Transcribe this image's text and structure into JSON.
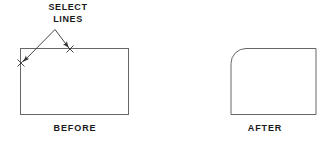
{
  "diagram": {
    "type": "cad-fillet-instruction",
    "background_color": "#ffffff",
    "line_color": "#555555",
    "leader_color": "#333333",
    "text_color": "#1a1a1a",
    "annotation": {
      "line1": "SELECT",
      "line2": "LINES"
    },
    "captions": {
      "before": "BEFORE",
      "after": "AFTER"
    },
    "before_shape": {
      "name": "rectangle",
      "x": 20,
      "y": 48,
      "width": 109,
      "height": 67
    },
    "after_shape": {
      "name": "rectangle-filleted-top-left",
      "x": 211,
      "y": 48,
      "width": 105,
      "height": 67,
      "fillet_radius": 15
    },
    "select_points": [
      {
        "label": "x-mark-left-edge",
        "x": 21,
        "y": 63
      },
      {
        "label": "x-mark-top-edge",
        "x": 70,
        "y": 49
      }
    ],
    "leader_apex": {
      "x": 55,
      "y": 29
    }
  }
}
